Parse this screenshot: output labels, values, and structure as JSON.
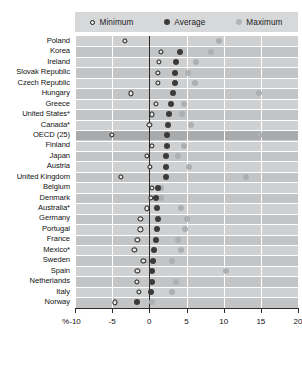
{
  "legend": {
    "items": [
      {
        "key": "minimum",
        "label": "Minimum",
        "marker": "open-circle",
        "color": "#e9eaea"
      },
      {
        "key": "average",
        "label": "Average",
        "marker": "filled-circle",
        "color": "#3b3b3b"
      },
      {
        "key": "maximum",
        "label": "Maximum",
        "marker": "filled-circle",
        "color": "#b2b3b4"
      }
    ]
  },
  "axis": {
    "unit_symbol": "%",
    "ticks": [
      -10,
      -5,
      0,
      5,
      10,
      15,
      20
    ],
    "tick_labels": [
      "-10",
      "-5",
      "0",
      "5",
      "10",
      "15",
      "20"
    ]
  },
  "chart_data": {
    "type": "scatter",
    "title": "",
    "subtitle": "",
    "xlabel": "%",
    "ylabel": "",
    "xlim": [
      -10,
      20
    ],
    "grid": true,
    "legend_position": "top",
    "orientation": "horizontal",
    "categories": [
      "Poland",
      "Korea",
      "Ireland",
      "Slovak Republic",
      "Czech Republic",
      "Hungary",
      "Greece",
      "United States*",
      "Canada*",
      "OECD (25)",
      "Finland",
      "Japan",
      "Austria",
      "United Kingdom",
      "Belgium",
      "Denmark",
      "Australia*",
      "Germany",
      "Portugal",
      "France",
      "Mexico*",
      "Sweden",
      "Spain",
      "Netherlands",
      "Italy",
      "Norway"
    ],
    "highlight_category": "OECD (25)",
    "series": [
      {
        "name": "Minimum",
        "values": [
          -3.3,
          1.6,
          1.3,
          1.2,
          1.1,
          -2.5,
          0.9,
          0.4,
          0.0,
          -5.0,
          0.3,
          -0.3,
          0.1,
          -3.8,
          0.3,
          0.2,
          -0.3,
          -1.2,
          -1.2,
          -1.6,
          -2.0,
          -0.8,
          -1.6,
          -1.7,
          -1.4,
          -4.6
        ]
      },
      {
        "name": "Average",
        "values": [
          null,
          4.1,
          3.6,
          3.5,
          3.4,
          3.2,
          2.9,
          2.7,
          2.5,
          2.4,
          2.4,
          2.3,
          2.2,
          2.2,
          1.2,
          0.9,
          1.0,
          1.1,
          1.0,
          0.9,
          0.6,
          0.5,
          0.4,
          0.3,
          0.2,
          -1.7
        ]
      },
      {
        "name": "Maximum",
        "values": [
          9.4,
          8.3,
          6.3,
          5.2,
          6.1,
          14.8,
          4.7,
          4.4,
          5.6,
          14.9,
          4.6,
          3.8,
          5.4,
          13.0,
          1.6,
          1.6,
          4.3,
          5.0,
          4.8,
          3.8,
          4.3,
          3.0,
          10.3,
          3.6,
          3.1,
          0.4
        ]
      }
    ]
  }
}
